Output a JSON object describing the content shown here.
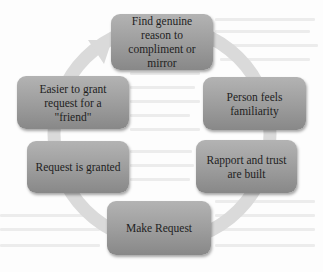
{
  "diagram": {
    "type": "cycle",
    "direction": "clockwise",
    "colors": {
      "node_fill_top": "#b3b3b3",
      "node_fill_bottom": "#888888",
      "ring": "#d9d9d9",
      "text": "#1e1e1e",
      "background": "#fdfdfd"
    },
    "nodes": [
      {
        "id": "n1",
        "label": "Find genuine reason to compliment or mirror"
      },
      {
        "id": "n2",
        "label": "Person feels familiarity"
      },
      {
        "id": "n3",
        "label": "Rapport and trust are built"
      },
      {
        "id": "n4",
        "label": "Make Request"
      },
      {
        "id": "n5",
        "label": "Request is granted"
      },
      {
        "id": "n6",
        "label": "Easier to grant request for a \"friend\""
      }
    ],
    "edges": [
      {
        "from": "n1",
        "to": "n2"
      },
      {
        "from": "n2",
        "to": "n3"
      },
      {
        "from": "n3",
        "to": "n4"
      },
      {
        "from": "n4",
        "to": "n5"
      },
      {
        "from": "n5",
        "to": "n6"
      },
      {
        "from": "n6",
        "to": "n1"
      }
    ]
  }
}
